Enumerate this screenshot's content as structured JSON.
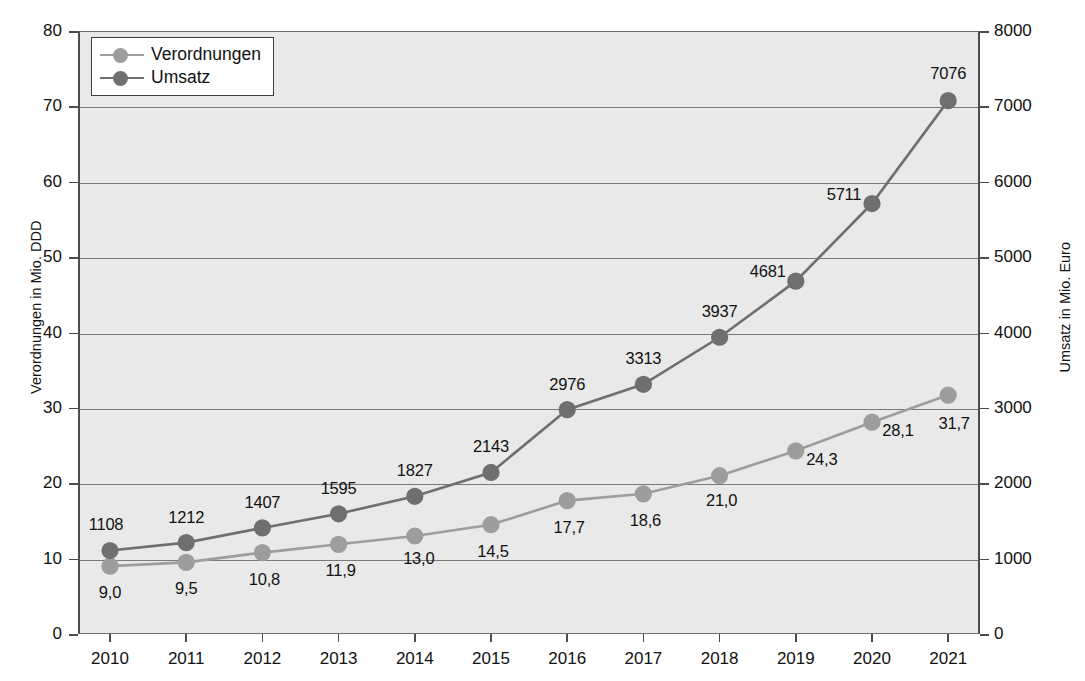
{
  "chart_data": {
    "type": "line",
    "title": "",
    "xlabel": "",
    "ylabel": "Verordnungen in Mio. DDD",
    "ylabel_right": "Umsatz in Mio. Euro",
    "categories": [
      "2010",
      "2011",
      "2012",
      "2013",
      "2014",
      "2015",
      "2016",
      "2017",
      "2018",
      "2019",
      "2020",
      "2021"
    ],
    "ylim": [
      0,
      80
    ],
    "ylim_right": [
      0,
      8000
    ],
    "yticks": [
      "0",
      "10",
      "20",
      "30",
      "40",
      "50",
      "60",
      "70",
      "80"
    ],
    "yticks_right": [
      "0",
      "1000",
      "2000",
      "3000",
      "4000",
      "5000",
      "6000",
      "7000",
      "8000"
    ],
    "grid": true,
    "legend_position": "top-left",
    "series": [
      {
        "name": "Verordnungen",
        "axis": "left",
        "color": "#9d9d9c",
        "values": [
          9.0,
          9.5,
          10.8,
          11.9,
          13.0,
          14.5,
          17.7,
          18.6,
          21.0,
          24.3,
          28.1,
          31.7
        ],
        "labels": [
          "9,0",
          "9,5",
          "10,8",
          "11,9",
          "13,0",
          "14,5",
          "17,7",
          "18,6",
          "21,0",
          "24,3",
          "28,1",
          "31,7"
        ]
      },
      {
        "name": "Umsatz",
        "axis": "right",
        "color": "#706f6f",
        "values": [
          1108,
          1212,
          1407,
          1595,
          1827,
          2143,
          2976,
          3313,
          3937,
          4681,
          5711,
          7076
        ],
        "labels": [
          "1108",
          "1212",
          "1407",
          "1595",
          "1827",
          "2143",
          "2976",
          "3313",
          "3937",
          "4681",
          "5711",
          "7076"
        ]
      }
    ]
  },
  "legend": {
    "items": [
      {
        "label": "Verordnungen"
      },
      {
        "label": "Umsatz"
      }
    ]
  }
}
